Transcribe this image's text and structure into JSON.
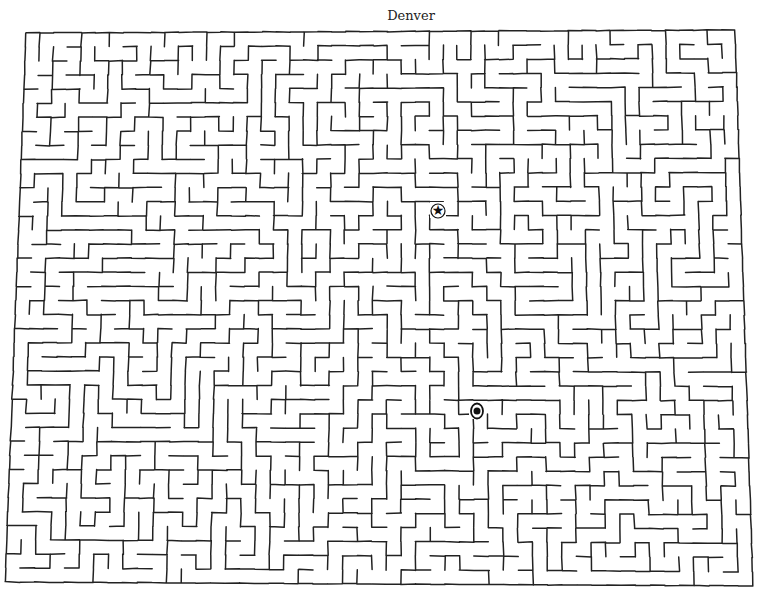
{
  "title": "Denver",
  "maze": {
    "columns": 51,
    "rows": 39,
    "seed": 1876,
    "corners": {
      "top_left": [
        26,
        33
      ],
      "top_right": [
        735,
        30
      ],
      "bottom_right": [
        753,
        586
      ],
      "bottom_left": [
        5,
        582
      ]
    },
    "line_color": "#222222",
    "line_width": 1.5,
    "background": "#ffffff"
  },
  "markers": [
    {
      "name": "capital-star",
      "label": "star",
      "x": 438,
      "y": 210,
      "symbol": "★"
    },
    {
      "name": "city-dot",
      "label": "circled dot",
      "x": 477,
      "y": 411,
      "symbol": "●"
    }
  ]
}
